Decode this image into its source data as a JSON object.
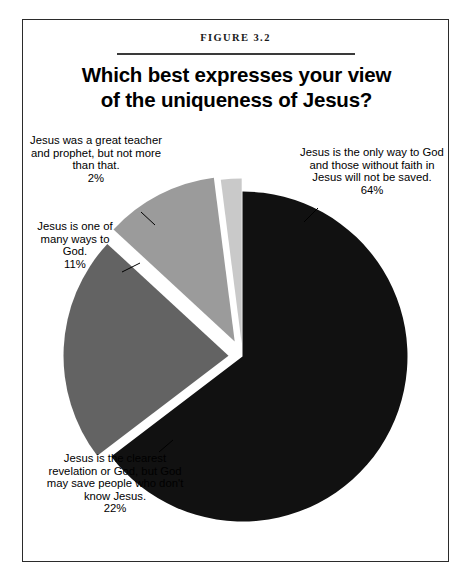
{
  "figure": {
    "caption": "FIGURE 3.2",
    "title_line1": "Which best expresses your view",
    "title_line2": "of the uniqueness of Jesus?"
  },
  "chart_data": {
    "type": "pie",
    "title": "Which best expresses your view of the uniqueness of Jesus?",
    "caption": "FIGURE 3.2",
    "xlabel": "",
    "ylabel": "",
    "legend_position": "none",
    "labels_outside": true,
    "exploded": true,
    "categories": [
      "Jesus is the only way to God and those without faith in Jesus will not be saved.",
      "Jesus is the clearest revelation or God, but God may save people who don't know Jesus.",
      "Jesus is one of many ways to God.",
      "Jesus was a great teacher and prophet, but not more than that."
    ],
    "values": [
      64,
      22,
      11,
      2
    ],
    "value_labels": [
      "64%",
      "22%",
      "11%",
      "2%"
    ],
    "colors": [
      "#111111",
      "#636363",
      "#9b9b9b",
      "#c9c9c9"
    ],
    "slice_border_color": "#ffffff"
  },
  "labels": {
    "only_way": {
      "text": "Jesus is the only way to God and those without faith in Jesus will not be saved.",
      "pct": "64%"
    },
    "clearest": {
      "text": "Jesus is the clearest revelation or God, but God may save people who don't know Jesus.",
      "pct": "22%"
    },
    "many_ways": {
      "text": "Jesus is one of many ways to God.",
      "pct": "11%"
    },
    "teacher": {
      "text": "Jesus was a great teacher and prophet, but not more than that.",
      "pct": "2%"
    }
  }
}
